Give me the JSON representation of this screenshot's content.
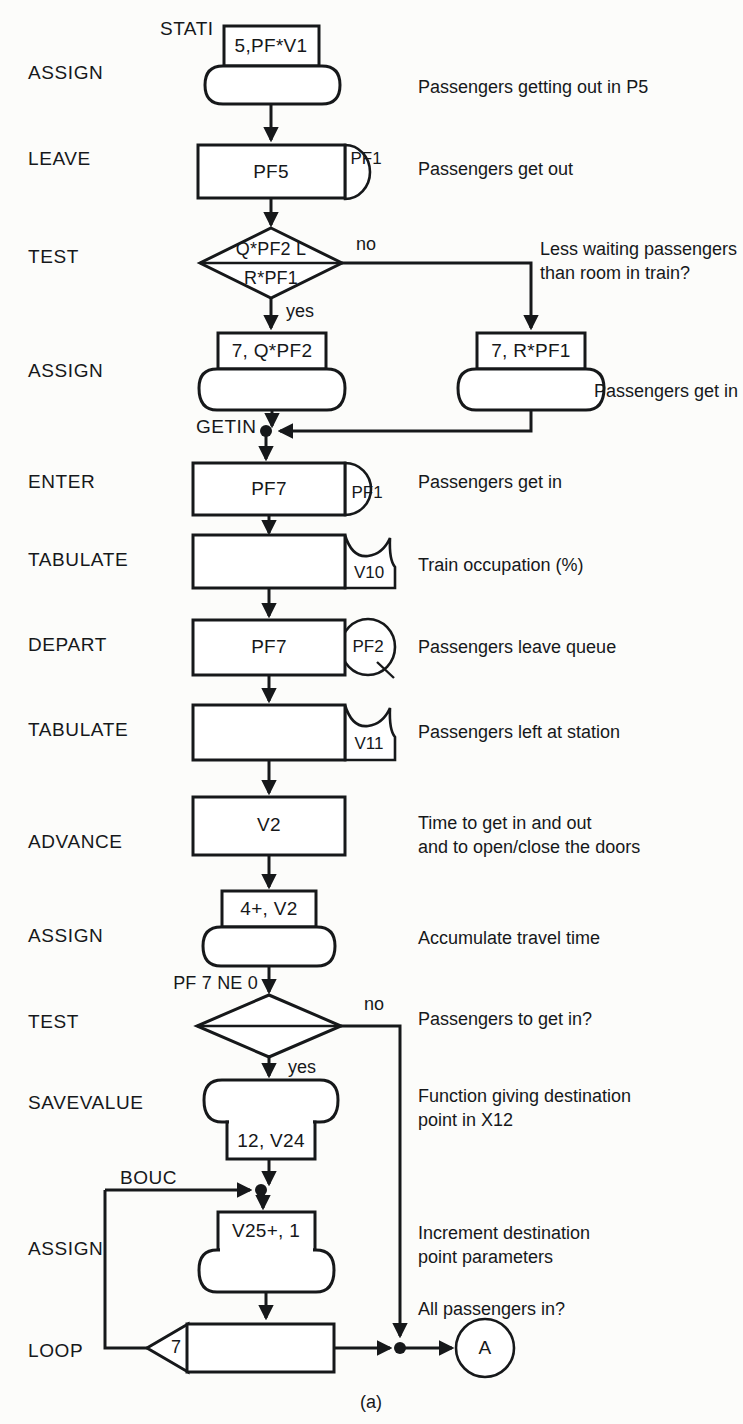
{
  "figure": {
    "caption": "(a)",
    "type": "GPSS simulation flowchart"
  },
  "operation_labels": [
    {
      "id": "assign-1",
      "text": "ASSIGN",
      "x": 28,
      "y": 74
    },
    {
      "id": "leave",
      "text": "LEAVE",
      "x": 28,
      "y": 160
    },
    {
      "id": "test-1",
      "text": "TEST",
      "x": 28,
      "y": 258
    },
    {
      "id": "assign-2",
      "text": "ASSIGN",
      "x": 28,
      "y": 372
    },
    {
      "id": "enter",
      "text": "ENTER",
      "x": 28,
      "y": 483
    },
    {
      "id": "tabulate-1",
      "text": "TABULATE",
      "x": 28,
      "y": 561
    },
    {
      "id": "depart",
      "text": "DEPART",
      "x": 28,
      "y": 646
    },
    {
      "id": "tabulate-2",
      "text": "TABULATE",
      "x": 28,
      "y": 731
    },
    {
      "id": "advance",
      "text": "ADVANCE",
      "x": 28,
      "y": 843
    },
    {
      "id": "assign-3",
      "text": "ASSIGN",
      "x": 28,
      "y": 937
    },
    {
      "id": "test-2",
      "text": "TEST",
      "x": 28,
      "y": 1023
    },
    {
      "id": "savevalue",
      "text": "SAVEVALUE",
      "x": 28,
      "y": 1104
    },
    {
      "id": "assign-4",
      "text": "ASSIGN",
      "x": 28,
      "y": 1250
    },
    {
      "id": "loop",
      "text": "LOOP",
      "x": 28,
      "y": 1352
    }
  ],
  "block_values": {
    "assign1_param": "5,PF*V1",
    "leave_body": "PF5",
    "leave_annot": "PF1",
    "test1_line1": "Q*PF2 L",
    "test1_line2": "R*PF1",
    "assign2_left_param": "7, Q*PF2",
    "assign2_right_param": "7, R*PF1",
    "enter_body": "PF7",
    "enter_annot": "PF1",
    "tabulate1_annot": "V10",
    "depart_body": "PF7",
    "depart_annot": "PF2",
    "tabulate2_annot": "V11",
    "advance_body": "V2",
    "assign3_param": "4+, V2",
    "test2_condition": "PF 7 NE 0",
    "savevalue_param": "12, V24",
    "assign4_param": "V25+, 1",
    "loop_param": "7",
    "connector_a": "A"
  },
  "flow_tags": [
    {
      "id": "stati",
      "text": "STATI",
      "x": 160,
      "y": 30
    },
    {
      "id": "getin",
      "text": "GETIN",
      "x": 196,
      "y": 428
    },
    {
      "id": "bouc",
      "text": "BOUC",
      "x": 120,
      "y": 1179
    }
  ],
  "branch_labels": [
    {
      "id": "test1-no",
      "text": "no",
      "x": 356,
      "y": 245
    },
    {
      "id": "test1-yes",
      "text": "yes",
      "x": 286,
      "y": 312
    },
    {
      "id": "test2-no",
      "text": "no",
      "x": 364,
      "y": 1005
    },
    {
      "id": "test2-yes",
      "text": "yes",
      "x": 288,
      "y": 1068
    }
  ],
  "descriptions": [
    {
      "id": "desc-assign-1",
      "lines": [
        "Passengers getting out in P5"
      ],
      "x": 418,
      "y": 88
    },
    {
      "id": "desc-leave",
      "lines": [
        "Passengers get out"
      ],
      "x": 418,
      "y": 170
    },
    {
      "id": "desc-test-1",
      "lines": [
        "Less waiting passengers",
        "than room in train?"
      ],
      "x": 540,
      "y": 258
    },
    {
      "id": "desc-assign-2",
      "lines": [
        "Passengers get in"
      ],
      "x": 594,
      "y": 392
    },
    {
      "id": "desc-enter",
      "lines": [
        "Passengers get in"
      ],
      "x": 418,
      "y": 483
    },
    {
      "id": "desc-tabulate-1",
      "lines": [
        "Train occupation (%)"
      ],
      "x": 418,
      "y": 566
    },
    {
      "id": "desc-depart",
      "lines": [
        "Passengers leave queue"
      ],
      "x": 418,
      "y": 648
    },
    {
      "id": "desc-tabulate-2",
      "lines": [
        "Passengers left at station"
      ],
      "x": 418,
      "y": 733
    },
    {
      "id": "desc-advance",
      "lines": [
        "Time to get in and out",
        "and to open/close the doors"
      ],
      "x": 418,
      "y": 836
    },
    {
      "id": "desc-assign-3",
      "lines": [
        "Accumulate travel time"
      ],
      "x": 418,
      "y": 939
    },
    {
      "id": "desc-test-2",
      "lines": [
        "Passengers to get in?"
      ],
      "x": 418,
      "y": 1020
    },
    {
      "id": "desc-savevalue",
      "lines": [
        "Function giving destination",
        "point in X12"
      ],
      "x": 418,
      "y": 1103
    },
    {
      "id": "desc-assign-4",
      "lines": [
        "Increment destination",
        "point parameters"
      ],
      "x": 418,
      "y": 1241
    },
    {
      "id": "desc-loop",
      "lines": [
        "All passengers in?"
      ],
      "x": 418,
      "y": 1310
    }
  ],
  "colors": {
    "ink": "#16181a",
    "paper": "#fcfcfa",
    "shape_fill": "#ffffff"
  }
}
